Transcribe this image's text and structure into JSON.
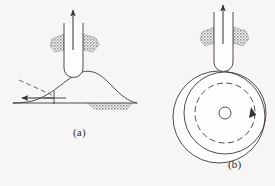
{
  "figure": {
    "type": "engineering-diagram",
    "background_color": "#f7f6f4",
    "line_color": "#3a3a3a",
    "flash_fill_color": "#a6a6a6",
    "chip_fill_color": "#9e9e9e",
    "panels": [
      {
        "id": "a",
        "caption": "(a)",
        "description": "linear workpiece with raised weld bead profile and tool plunged into surface",
        "elements": [
          "up-arrow-force",
          "rotating-tool-body",
          "tool-rounded-tip",
          "left-flash-wedge",
          "right-flash-wedge",
          "weld-bead-profile-curve",
          "baseline",
          "feed-direction-arrow",
          "leader-line",
          "tee-marker",
          "hatched-subsurface-zone"
        ]
      },
      {
        "id": "b",
        "caption": "(b)",
        "description": "circular rotating workpiece contacted from above by the tool",
        "elements": [
          "up-arrow-force",
          "rotating-tool-body",
          "tool-rounded-tip",
          "left-flash-wedge",
          "right-flash-wedge",
          "outer-workpiece-circle",
          "inner-workpiece-circle",
          "dashed-rotation-circle",
          "rotation-direction-arrowhead",
          "center-hole-circle"
        ]
      }
    ]
  },
  "captions": {
    "panel_a": "(a)",
    "panel_b": "(b)"
  },
  "geometry": {
    "panel_a": {
      "tool": {
        "x": 64,
        "y": 23,
        "width": 19,
        "height": 54,
        "tip_radius": 9
      },
      "force_arrow": {
        "x": 73,
        "y_tail": 44,
        "y_head": 7
      },
      "baseline": {
        "x1": 13,
        "x2": 137,
        "y": 103
      },
      "feed_arrow": {
        "x_tail": 52,
        "x_head": 22,
        "y": 98
      },
      "bead_peak": {
        "x": 93,
        "y": 72
      },
      "hatch_zone": {
        "x1": 86,
        "x2": 133,
        "y_top": 103,
        "y_bottom": 110
      }
    },
    "panel_b": {
      "tool": {
        "x": 214,
        "y": 8,
        "width": 19,
        "height": 62,
        "tip_radius": 9
      },
      "force_arrow": {
        "x": 223,
        "y_tail": 30,
        "y_head": 4
      },
      "outer_circle": {
        "cx": 219,
        "cy": 117,
        "r": 46
      },
      "inner_circle": {
        "cx": 224,
        "cy": 113,
        "r": 41
      },
      "dashed_circle": {
        "cx": 224,
        "cy": 113,
        "r": 30
      },
      "center_circle": {
        "cx": 224,
        "cy": 113,
        "r": 6
      }
    }
  }
}
